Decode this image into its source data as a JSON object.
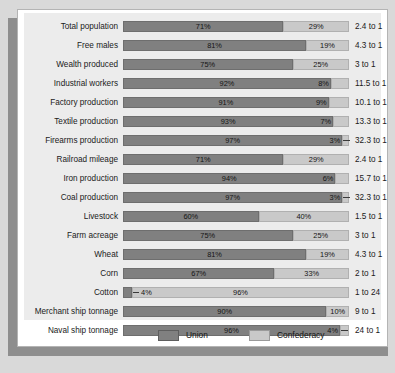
{
  "legend": {
    "entries": [
      {
        "label": "Union",
        "color": "#808080",
        "key": "union"
      },
      {
        "label": "Confederacy",
        "color": "#c9c9c9",
        "key": "confederacy"
      }
    ]
  },
  "colors": {
    "union": "#808080",
    "confederacy": "#c9c9c9",
    "plot_background": "#ececec",
    "card_background": "#ffffff",
    "page_background": "#d9d9d9",
    "shadow": "#8e8e8e"
  },
  "chart_data": {
    "type": "bar",
    "orientation": "horizontal",
    "stacked": true,
    "normalized": true,
    "title": "",
    "subtitle": "",
    "xlabel": "",
    "ylabel": "",
    "xlim": [
      0,
      100
    ],
    "grid": false,
    "legend_position": "bottom",
    "series": [
      {
        "name": "Union",
        "values": [
          71,
          81,
          75,
          92,
          91,
          93,
          97,
          71,
          94,
          97,
          60,
          75,
          81,
          67,
          4,
          90,
          96
        ]
      },
      {
        "name": "Confederacy",
        "values": [
          29,
          19,
          25,
          8,
          9,
          7,
          3,
          29,
          6,
          3,
          40,
          25,
          19,
          33,
          96,
          10,
          4
        ]
      }
    ],
    "categories": [
      "Total population",
      "Free males",
      "Wealth produced",
      "Industrial workers",
      "Factory production",
      "Textile production",
      "Firearms production",
      "Railroad mileage",
      "Iron production",
      "Coal production",
      "Livestock",
      "Farm acreage",
      "Wheat",
      "Corn",
      "Cotton",
      "Merchant ship tonnage",
      "Naval ship tonnage"
    ],
    "annotations": [
      "2.4 to 1",
      "4.3 to 1",
      "3 to 1",
      "11.5 to 1",
      "10.1 to 1",
      "13.3 to 1",
      "32.3 to 1",
      "2.4 to 1",
      "15.7 to 1",
      "32.3 to 1",
      "1.5 to 1",
      "3 to 1",
      "4.3 to 1",
      "2 to 1",
      "1 to 24",
      "9 to 1",
      "24 to 1"
    ],
    "rows": [
      {
        "category": "Total population",
        "union": 71,
        "confederacy": 29,
        "union_label": "71%",
        "confederacy_label": "29%",
        "ratio": "2.4 to 1",
        "leader": "none"
      },
      {
        "category": "Free males",
        "union": 81,
        "confederacy": 19,
        "union_label": "81%",
        "confederacy_label": "19%",
        "ratio": "4.3 to 1",
        "leader": "none"
      },
      {
        "category": "Wealth produced",
        "union": 75,
        "confederacy": 25,
        "union_label": "75%",
        "confederacy_label": "25%",
        "ratio": "3 to 1",
        "leader": "none"
      },
      {
        "category": "Industrial workers",
        "union": 92,
        "confederacy": 8,
        "union_label": "92%",
        "confederacy_label": "8%",
        "ratio": "11.5 to 1",
        "leader": "none"
      },
      {
        "category": "Factory production",
        "union": 91,
        "confederacy": 9,
        "union_label": "91%",
        "confederacy_label": "9%",
        "ratio": "10.1 to 1",
        "leader": "none"
      },
      {
        "category": "Textile production",
        "union": 93,
        "confederacy": 7,
        "union_label": "93%",
        "confederacy_label": "7%",
        "ratio": "13.3 to 1",
        "leader": "none"
      },
      {
        "category": "Firearms production",
        "union": 97,
        "confederacy": 3,
        "union_label": "97%",
        "confederacy_label": "3%",
        "ratio": "32.3 to 1",
        "leader": "right"
      },
      {
        "category": "Railroad mileage",
        "union": 71,
        "confederacy": 29,
        "union_label": "71%",
        "confederacy_label": "29%",
        "ratio": "2.4 to 1",
        "leader": "none"
      },
      {
        "category": "Iron production",
        "union": 94,
        "confederacy": 6,
        "union_label": "94%",
        "confederacy_label": "6%",
        "ratio": "15.7 to 1",
        "leader": "none"
      },
      {
        "category": "Coal production",
        "union": 97,
        "confederacy": 3,
        "union_label": "97%",
        "confederacy_label": "3%",
        "ratio": "32.3 to 1",
        "leader": "right"
      },
      {
        "category": "Livestock",
        "union": 60,
        "confederacy": 40,
        "union_label": "60%",
        "confederacy_label": "40%",
        "ratio": "1.5 to 1",
        "leader": "none"
      },
      {
        "category": "Farm acreage",
        "union": 75,
        "confederacy": 25,
        "union_label": "75%",
        "confederacy_label": "25%",
        "ratio": "3 to 1",
        "leader": "none"
      },
      {
        "category": "Wheat",
        "union": 81,
        "confederacy": 19,
        "union_label": "81%",
        "confederacy_label": "19%",
        "ratio": "4.3 to 1",
        "leader": "none"
      },
      {
        "category": "Corn",
        "union": 67,
        "confederacy": 33,
        "union_label": "67%",
        "confederacy_label": "33%",
        "ratio": "2 to 1",
        "leader": "none"
      },
      {
        "category": "Cotton",
        "union": 4,
        "confederacy": 96,
        "union_label": "4%",
        "confederacy_label": "96%",
        "ratio": "1 to 24",
        "leader": "left"
      },
      {
        "category": "Merchant ship tonnage",
        "union": 90,
        "confederacy": 10,
        "union_label": "90%",
        "confederacy_label": "10%",
        "ratio": "9 to 1",
        "leader": "none"
      },
      {
        "category": "Naval ship tonnage",
        "union": 96,
        "confederacy": 4,
        "union_label": "96%",
        "confederacy_label": "4%",
        "ratio": "24 to 1",
        "leader": "right"
      }
    ]
  }
}
